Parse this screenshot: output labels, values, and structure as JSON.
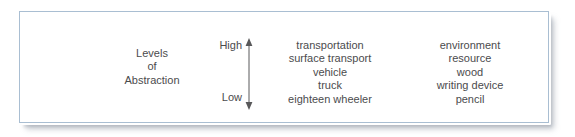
{
  "figure": {
    "caption_block": {
      "lines": [
        "Levels",
        "of",
        "Abstraction"
      ]
    },
    "scale": {
      "high_label": "High",
      "low_label": "Low",
      "arrow_icon": "double-headed-vertical-arrow"
    },
    "columns": [
      {
        "name": "transportation-hierarchy",
        "terms": [
          "transportation",
          "surface transport",
          "vehicle",
          "truck",
          "eighteen wheeler"
        ]
      },
      {
        "name": "environment-hierarchy",
        "terms": [
          "environment",
          "resource",
          "wood",
          "writing device",
          "pencil"
        ]
      }
    ],
    "colors": {
      "panel_border": "#a9bed2",
      "panel_background": "#ffffff",
      "text": "#4b4b4d",
      "arrow": "#58585a"
    }
  }
}
